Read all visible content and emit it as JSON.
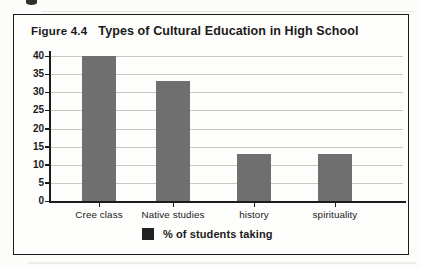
{
  "header": {
    "figure_label": "Figure 4.4",
    "title": "Types of Cultural Education in High School"
  },
  "legend": {
    "label": "% of students taking",
    "swatch_color": "#212121"
  },
  "colors": {
    "bar": "#6f6f6f",
    "gridline": "#c7c7c3",
    "axis": "#1c1c1c",
    "frame_border": "#1c1c1c",
    "background": "#fdfdfb"
  },
  "chart_data": {
    "type": "bar",
    "figure_label": "Figure 4.4",
    "title": "Types of Cultural Education in High School",
    "categories": [
      "Cree class",
      "Native studies",
      "history",
      "spirituality"
    ],
    "values": [
      40,
      33,
      13,
      13
    ],
    "series_name": "% of students taking",
    "xlabel": "",
    "ylabel": "",
    "ylim": [
      0,
      40
    ],
    "y_ticks": [
      0,
      5,
      10,
      15,
      20,
      25,
      30,
      35,
      40
    ],
    "grid": true,
    "legend_position": "bottom",
    "bar_color": "#6f6f6f"
  }
}
